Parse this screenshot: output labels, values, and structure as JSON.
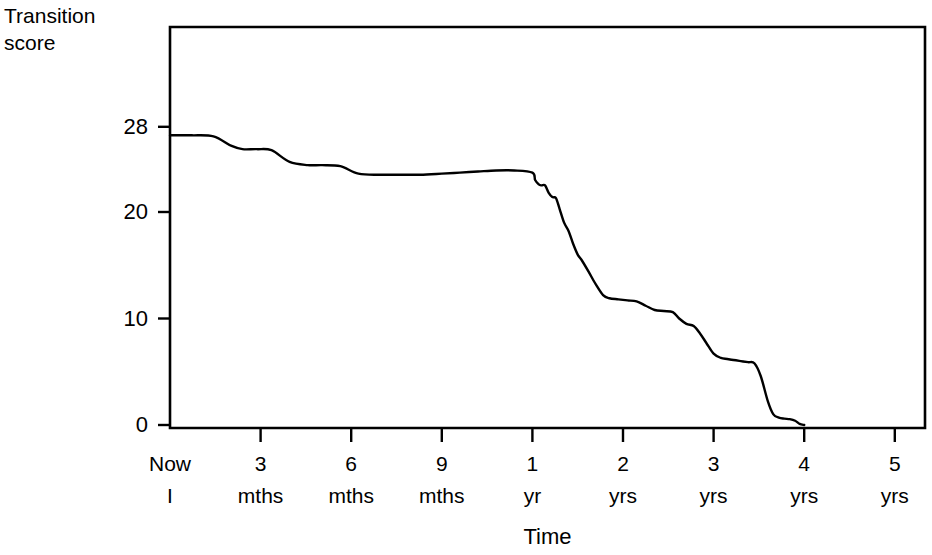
{
  "chart_data": {
    "type": "line",
    "title": "",
    "ylabel": "Transition score",
    "ylabel_lines": [
      "Transition",
      "score"
    ],
    "xlabel": "Time",
    "ytick_values": [
      0,
      10,
      20,
      28
    ],
    "ytick_labels": [
      "0",
      "10",
      "20",
      "28"
    ],
    "ylim": [
      0,
      31.5
    ],
    "xlim": [
      0,
      5.25
    ],
    "grid": false,
    "legend": false,
    "xtick_positions_years": [
      0,
      0.25,
      0.5,
      0.75,
      1,
      2,
      3,
      4,
      5
    ],
    "xticks": [
      {
        "top": "Now",
        "bottom": "I"
      },
      {
        "top": "3",
        "bottom": "mths"
      },
      {
        "top": "6",
        "bottom": "mths"
      },
      {
        "top": "9",
        "bottom": "mths"
      },
      {
        "top": "1",
        "bottom": "yr"
      },
      {
        "top": "2",
        "bottom": "yrs"
      },
      {
        "top": "3",
        "bottom": "yrs"
      },
      {
        "top": "4",
        "bottom": "yrs"
      },
      {
        "top": "5",
        "bottom": "yrs"
      }
    ],
    "series": [
      {
        "name": "Transition score",
        "color": "#000000",
        "x": [
          0.0,
          0.06,
          0.12,
          0.17,
          0.2,
          0.24,
          0.28,
          0.33,
          0.38,
          0.42,
          0.47,
          0.52,
          0.58,
          0.63,
          0.69,
          0.75,
          0.8,
          0.85,
          0.9,
          0.95,
          1.0,
          1.03,
          1.07,
          1.1,
          1.14,
          1.18,
          1.22,
          1.26,
          1.3,
          1.35,
          1.4,
          1.45,
          1.5,
          1.55,
          1.62,
          1.7,
          1.78,
          1.85,
          1.95,
          2.05,
          2.15,
          2.25,
          2.35,
          2.45,
          2.55,
          2.62,
          2.7,
          2.78,
          2.85,
          2.92,
          3.0,
          3.08,
          3.15,
          3.22,
          3.3,
          3.38,
          3.45,
          3.52,
          3.6,
          3.66,
          3.72,
          3.78,
          3.84,
          3.9,
          3.95,
          4.0
        ],
        "y": [
          27.2,
          27.2,
          27.1,
          26.2,
          25.9,
          25.9,
          25.8,
          24.7,
          24.4,
          24.4,
          24.3,
          23.6,
          23.5,
          23.5,
          23.5,
          23.6,
          23.7,
          23.8,
          23.9,
          23.9,
          23.7,
          23.0,
          22.6,
          22.5,
          22.5,
          21.8,
          21.4,
          21.3,
          20.3,
          19.0,
          18.2,
          17.0,
          16.0,
          15.4,
          14.4,
          13.2,
          12.2,
          11.9,
          11.8,
          11.7,
          11.6,
          11.2,
          10.8,
          10.7,
          10.6,
          10.0,
          9.5,
          9.3,
          8.6,
          7.7,
          6.7,
          6.3,
          6.2,
          6.1,
          6.0,
          5.9,
          5.8,
          4.6,
          2.2,
          1.0,
          0.7,
          0.6,
          0.55,
          0.4,
          0.1,
          0.0
        ]
      }
    ],
    "annotations": []
  },
  "geometry": {
    "plot_left": 170,
    "plot_right": 925,
    "plot_top": 27,
    "plot_bottom": 428,
    "y_zero_px": 425,
    "y_per_unit_px": 10.65,
    "x_now_px": 170,
    "x_quarter_step_px": 90.6
  }
}
